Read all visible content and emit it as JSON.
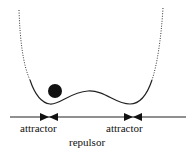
{
  "diagram": {
    "type": "double-well potential",
    "labels": {
      "left_attractor": "attractor",
      "right_attractor": "attractor",
      "repulsor": "repulsor"
    },
    "colors": {
      "line": "#222222",
      "ball": "#111111",
      "background": "#ffffff"
    }
  }
}
